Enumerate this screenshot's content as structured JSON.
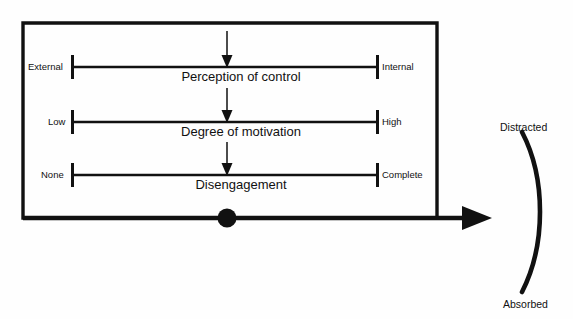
{
  "figure": {
    "background": "#fefefe",
    "ink_color": "#111111"
  },
  "container": {
    "name": "flow-box",
    "shape": "rectangle"
  },
  "axes": [
    {
      "id": "perception-of-control",
      "title": "Perception of control",
      "left_label": "External",
      "right_label": "Internal",
      "marker": "down-arrow",
      "marker_position_fraction": 0.5
    },
    {
      "id": "degree-of-motivation",
      "title": "Degree of motivation",
      "left_label": "Low",
      "right_label": "High",
      "marker": "down-arrow",
      "marker_position_fraction": 0.5
    },
    {
      "id": "disengagement",
      "title": "Disengagement",
      "left_label": "None",
      "right_label": "Complete",
      "marker": "down-arrow",
      "marker_position_fraction": 0.5
    }
  ],
  "baseline": {
    "name": "outcome-arrow",
    "has_node_dot": true,
    "direction": "right"
  },
  "brace": {
    "top_label": "Distracted",
    "bottom_label": "Absorbed",
    "shape": "arc"
  }
}
